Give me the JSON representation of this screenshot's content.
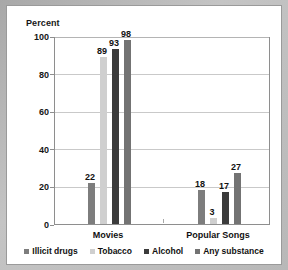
{
  "chart_data": {
    "type": "bar",
    "title": "",
    "subtitle": "",
    "ylabel": "Percent",
    "xlabel": "",
    "categories": [
      "Movies",
      "Popular Songs"
    ],
    "series": [
      {
        "name": "Illicit drugs",
        "values": [
          22,
          18
        ],
        "color": "#7d7d7d"
      },
      {
        "name": "Tobacco",
        "values": [
          89,
          3
        ],
        "color": "#cfcfcf"
      },
      {
        "name": "Alcohol",
        "values": [
          93,
          17
        ],
        "color": "#3b3b3b"
      },
      {
        "name": "Any substance",
        "values": [
          98,
          27
        ],
        "color": "#737373"
      }
    ],
    "ylim": [
      0,
      100
    ],
    "yticks": [
      0,
      20,
      40,
      60,
      80,
      100
    ],
    "ytick_labels": [
      "0",
      "20",
      "40",
      "60",
      "80",
      "100"
    ],
    "grid": true,
    "legend_position": "bottom",
    "data_labels": [
      "22",
      "89",
      "93",
      "98",
      "18",
      "3",
      "17",
      "27"
    ]
  },
  "legend": {
    "items": [
      {
        "label": "Illicit drugs",
        "color": "#7d7d7d"
      },
      {
        "label": "Tobacco",
        "color": "#cfcfcf"
      },
      {
        "label": "Alcohol",
        "color": "#3b3b3b"
      },
      {
        "label": "Any substance",
        "color": "#737373"
      }
    ]
  },
  "colors": {
    "page_background": "#b8b8b8",
    "panel_background": "#ffffff",
    "axis": "#8e8e8e",
    "gridline": "#c9c9c9",
    "text": "#111111"
  }
}
